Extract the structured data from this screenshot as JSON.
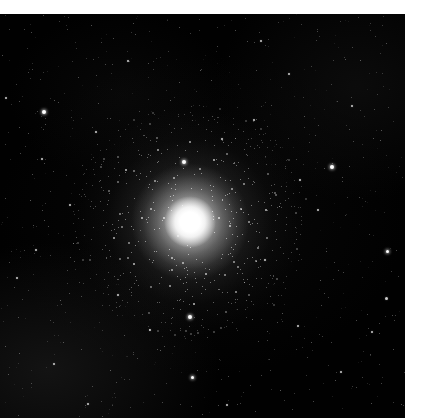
{
  "page": {
    "width": 421,
    "height": 418,
    "background_color": "#ffffff"
  },
  "caption": {
    "text": "",
    "note": "clipped-illegible-text-row",
    "color": "#d9d9d9"
  },
  "image": {
    "title": "globular-cluster-field",
    "frame": {
      "x": 0,
      "y": 14,
      "width": 405,
      "height": 404,
      "background_color": "#010101"
    },
    "subject": {
      "name": "globular-cluster",
      "center_x": 190,
      "center_y": 222,
      "core_diameter_px": 52,
      "halo_diameter_px": 230,
      "core_color": "#ffffff",
      "halo_color": "#cccccc"
    },
    "field_stars": [
      {
        "x": 44,
        "y": 112,
        "size": 4,
        "class": "bright"
      },
      {
        "x": 332,
        "y": 167,
        "size": 4,
        "class": "bright"
      },
      {
        "x": 184,
        "y": 162,
        "size": 4,
        "class": "bright"
      },
      {
        "x": 190,
        "y": 317,
        "size": 4,
        "class": "bright"
      },
      {
        "x": 192,
        "y": 377,
        "size": 3,
        "class": "bright"
      },
      {
        "x": 387,
        "y": 251,
        "size": 3,
        "class": "bright"
      },
      {
        "x": 386,
        "y": 298,
        "size": 3,
        "class": "medium"
      },
      {
        "x": 36,
        "y": 250,
        "size": 2,
        "class": "medium"
      },
      {
        "x": 6,
        "y": 98,
        "size": 2,
        "class": "medium"
      },
      {
        "x": 42,
        "y": 159,
        "size": 2,
        "class": "medium"
      },
      {
        "x": 96,
        "y": 132,
        "size": 2,
        "class": "medium"
      },
      {
        "x": 128,
        "y": 61,
        "size": 2,
        "class": "medium"
      },
      {
        "x": 261,
        "y": 41,
        "size": 2,
        "class": "medium"
      },
      {
        "x": 289,
        "y": 74,
        "size": 2,
        "class": "medium"
      },
      {
        "x": 352,
        "y": 106,
        "size": 2,
        "class": "medium"
      },
      {
        "x": 300,
        "y": 180,
        "size": 2,
        "class": "medium"
      },
      {
        "x": 254,
        "y": 120,
        "size": 2,
        "class": "medium"
      },
      {
        "x": 222,
        "y": 139,
        "size": 2,
        "class": "medium"
      },
      {
        "x": 70,
        "y": 205,
        "size": 2,
        "class": "medium"
      },
      {
        "x": 17,
        "y": 278,
        "size": 2,
        "class": "medium"
      },
      {
        "x": 54,
        "y": 364,
        "size": 2,
        "class": "medium"
      },
      {
        "x": 118,
        "y": 295,
        "size": 2,
        "class": "medium"
      },
      {
        "x": 150,
        "y": 330,
        "size": 2,
        "class": "medium"
      },
      {
        "x": 265,
        "y": 260,
        "size": 2,
        "class": "medium"
      },
      {
        "x": 298,
        "y": 326,
        "size": 2,
        "class": "medium"
      },
      {
        "x": 341,
        "y": 372,
        "size": 2,
        "class": "medium"
      },
      {
        "x": 372,
        "y": 332,
        "size": 2,
        "class": "medium"
      },
      {
        "x": 227,
        "y": 405,
        "size": 2,
        "class": "medium"
      },
      {
        "x": 88,
        "y": 404,
        "size": 2,
        "class": "medium"
      },
      {
        "x": 318,
        "y": 210,
        "size": 2,
        "class": "medium"
      },
      {
        "x": 246,
        "y": 300,
        "size": 1,
        "class": "faint"
      },
      {
        "x": 205,
        "y": 268,
        "size": 1,
        "class": "faint"
      },
      {
        "x": 140,
        "y": 230,
        "size": 1,
        "class": "faint"
      },
      {
        "x": 160,
        "y": 350,
        "size": 1,
        "class": "faint"
      },
      {
        "x": 100,
        "y": 180,
        "size": 1,
        "class": "faint"
      },
      {
        "x": 60,
        "y": 300,
        "size": 1,
        "class": "faint"
      },
      {
        "x": 280,
        "y": 390,
        "size": 1,
        "class": "faint"
      },
      {
        "x": 360,
        "y": 60,
        "size": 1,
        "class": "faint"
      },
      {
        "x": 200,
        "y": 70,
        "size": 1,
        "class": "faint"
      },
      {
        "x": 320,
        "y": 280,
        "size": 1,
        "class": "faint"
      },
      {
        "x": 30,
        "y": 200,
        "size": 1,
        "class": "faint"
      },
      {
        "x": 380,
        "y": 140,
        "size": 1,
        "class": "faint"
      },
      {
        "x": 240,
        "y": 200,
        "size": 1,
        "class": "faint"
      },
      {
        "x": 110,
        "y": 370,
        "size": 1,
        "class": "faint"
      },
      {
        "x": 170,
        "y": 100,
        "size": 1,
        "class": "faint"
      }
    ]
  }
}
